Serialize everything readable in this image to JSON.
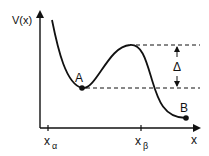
{
  "diagram": {
    "y_axis_label": "V(x)",
    "x_axis_label": "x",
    "ticks": [
      {
        "base": "x",
        "sub": "α"
      },
      {
        "base": "x",
        "sub": "β"
      }
    ],
    "points": [
      {
        "label": "A"
      },
      {
        "label": "B"
      }
    ],
    "barrier_label": "Δ",
    "colors": {
      "ink": "#111111",
      "background": "#ffffff"
    }
  }
}
